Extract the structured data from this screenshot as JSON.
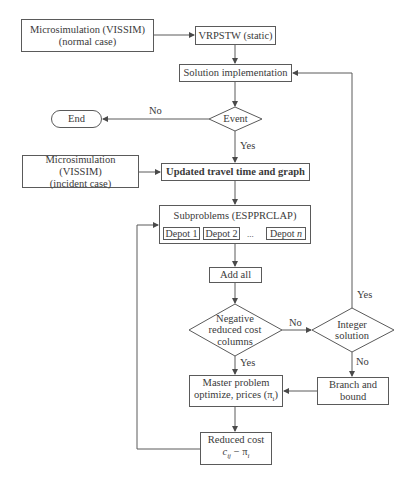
{
  "diagram": {
    "type": "flowchart",
    "nodes": {
      "micro_normal": {
        "line1": "Microsimulation (VISSIM)",
        "line2": "(normal case)"
      },
      "vrpstw": {
        "label": "VRPSTW (static)"
      },
      "solution_impl": {
        "label": "Solution implementation"
      },
      "event": {
        "label": "Event"
      },
      "end": {
        "label": "End"
      },
      "micro_incident": {
        "line1": "Microsimulation (VISSIM)",
        "line2": "(incident case)"
      },
      "updated_travel": {
        "label": "Updated travel time and graph"
      },
      "subproblems": {
        "label": "Subproblems (ESPPRCLAP)",
        "depots": [
          "Depot 1",
          "Depot 2",
          "Depot n"
        ],
        "ellipsis": "..."
      },
      "add_all": {
        "label": "Add all"
      },
      "negative_reduced": {
        "line1": "Negative",
        "line2": "reduced cost",
        "line3": "columns"
      },
      "integer_solution": {
        "line1": "Integer",
        "line2": "solution"
      },
      "master_problem": {
        "line1": "Master problem",
        "line2": "optimize, prices (π",
        "line2_sub": "i",
        "line2_end": ")"
      },
      "branch_bound": {
        "line1": "Branch and",
        "line2": "bound"
      },
      "reduced_cost": {
        "line1": "Reduced cost",
        "formula_c": "c",
        "formula_sub": "ij",
        "formula_rest": " − π",
        "formula_sub2": "i"
      }
    },
    "edge_labels": {
      "event_no": "No",
      "event_yes": "Yes",
      "negative_no": "No",
      "negative_yes": "Yes",
      "integer_yes": "Yes",
      "integer_no": "No"
    },
    "colors": {
      "stroke": "#5a5a5a",
      "text": "#3a3a3a",
      "background": "#ffffff"
    }
  }
}
